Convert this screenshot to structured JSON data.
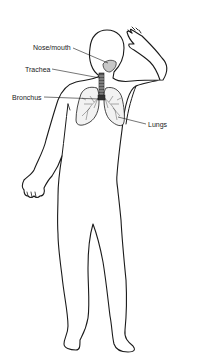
{
  "diagram": {
    "type": "anatomical-illustration",
    "colors": {
      "outline": "#1a1a1a",
      "background": "#ffffff",
      "organ_fill": "#d8d8d8"
    },
    "labels": [
      {
        "id": "nose-mouth",
        "text": "Nose/mouth",
        "x": 33,
        "y": 44
      },
      {
        "id": "trachea",
        "text": "Trachea",
        "x": 25,
        "y": 66
      },
      {
        "id": "bronchus",
        "text": "Bronchus",
        "x": 12,
        "y": 94
      },
      {
        "id": "lungs",
        "text": "Lungs",
        "x": 148,
        "y": 121
      }
    ]
  }
}
